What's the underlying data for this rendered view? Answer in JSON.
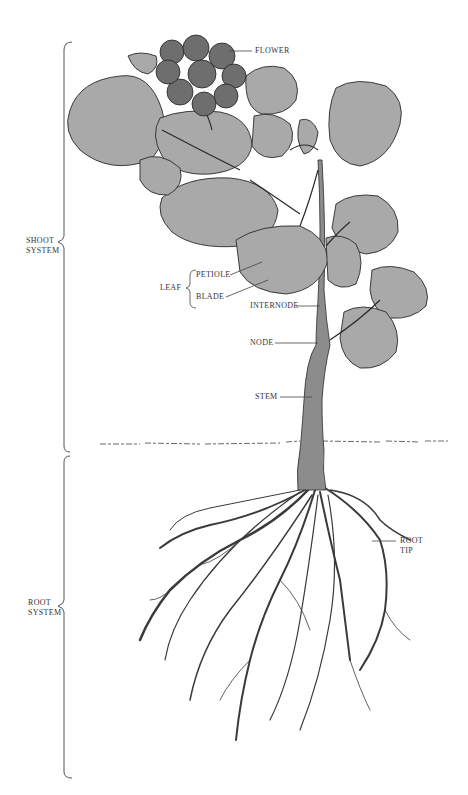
{
  "diagram": {
    "labels": {
      "flower": "FLOWER",
      "shoot_system": [
        "SHOOT",
        "SYSTEM"
      ],
      "leaf": "LEAF",
      "petiole": "PETIOLE",
      "blade": "BLADE",
      "internode": "INTERNODE",
      "node": "NODE",
      "stem": "STEM",
      "root_tip": [
        "ROOT",
        "TIP"
      ],
      "root_system": [
        "ROOT",
        "SYSTEM"
      ]
    },
    "colors": {
      "leaf_fill": "#a9a9a9",
      "flower_fill": "#6e6e6e",
      "stem_fill": "#8c8c8c",
      "ink": "#2b2b2b",
      "label": "#333333"
    }
  }
}
